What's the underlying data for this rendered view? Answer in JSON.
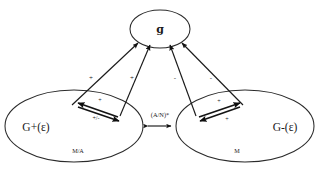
{
  "diagram": {
    "type": "causal-loop-diagram",
    "background_color": "#ffffff",
    "stroke_color": "#1a1a1a",
    "nodes": {
      "top": {
        "label": "ɡ",
        "name": "growth-rate-node",
        "cx": 160,
        "cy": 29,
        "rx": 30,
        "ry": 19
      },
      "left": {
        "label": "G+(ε)",
        "sublabel": "M/A",
        "name": "g-plus-node",
        "cx": 74,
        "cy": 126,
        "rx": 69,
        "ry": 36
      },
      "right": {
        "label": "G-(ε)",
        "sublabel": "M",
        "name": "g-minus-node",
        "cx": 245,
        "cy": 126,
        "rx": 69,
        "ry": 36
      }
    },
    "edges": {
      "left_outer_sign": "+",
      "left_inner_sign": "+",
      "right_inner_sign": "-",
      "right_outer_sign": "-",
      "between_nodes_label": "(A/N)*",
      "left_pair_top_sign": "+",
      "left_pair_bottom_sign": "+/-",
      "right_pair_top_sign": "+",
      "right_pair_bottom_sign": "+"
    }
  }
}
